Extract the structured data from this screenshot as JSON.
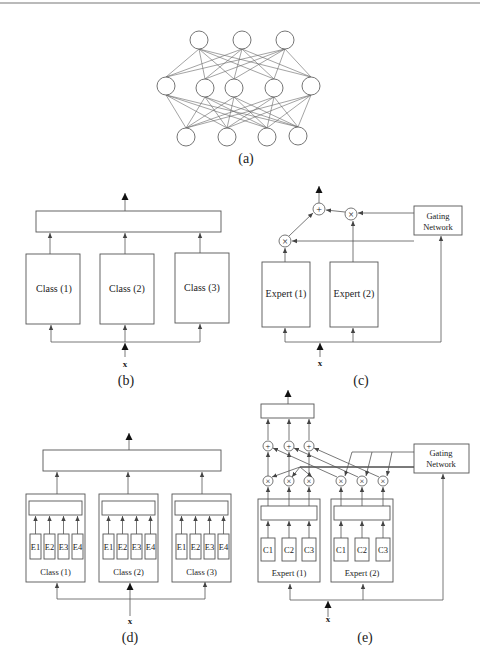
{
  "figure": {
    "panels": [
      {
        "id": "a",
        "caption": "(a)",
        "type": "neural-network",
        "layers": [
          3,
          5,
          4
        ]
      },
      {
        "id": "b",
        "caption": "(b)",
        "input": "x",
        "modules": [
          "Class (1)",
          "Class (2)",
          "Class (3)"
        ]
      },
      {
        "id": "c",
        "caption": "(c)",
        "input": "x",
        "modules": [
          "Expert (1)",
          "Expert (2)"
        ],
        "gating": "Gating Network",
        "ops": {
          "mult": "×",
          "add": "+"
        }
      },
      {
        "id": "d",
        "caption": "(d)",
        "input": "x",
        "modules": [
          "Class (1)",
          "Class (2)",
          "Class (3)"
        ],
        "submodules": [
          "E1",
          "E2",
          "E3",
          "E4"
        ]
      },
      {
        "id": "e",
        "caption": "(e)",
        "input": "x",
        "modules": [
          "Expert (1)",
          "Expert (2)"
        ],
        "submodules": [
          "C1",
          "C2",
          "C3"
        ],
        "gating": "Gating Network",
        "ops": {
          "mult": "×",
          "add": "+"
        }
      }
    ],
    "gating_line1": "Gating",
    "gating_line2": "Network"
  }
}
